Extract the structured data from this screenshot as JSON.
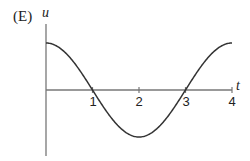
{
  "figure": {
    "label": "(E)"
  },
  "chart_data": {
    "type": "line",
    "title": "",
    "panel_label": "(E)",
    "xlabel": "t",
    "ylabel": "u",
    "xticks": [
      1,
      2,
      3,
      4
    ],
    "xtick_labels": [
      "1",
      "2",
      "3",
      "4"
    ],
    "xlim": [
      0,
      4
    ],
    "ylim": [
      -1.2,
      1.2
    ],
    "grid": false,
    "legend": null,
    "series": [
      {
        "name": "u(t)",
        "x": [
          0,
          0.25,
          0.5,
          0.75,
          1,
          1.25,
          1.5,
          1.75,
          2,
          2.25,
          2.5,
          2.75,
          3,
          3.25,
          3.5,
          3.75,
          4
        ],
        "y": [
          1,
          0.92,
          0.71,
          0.38,
          0,
          -0.38,
          -0.71,
          -0.92,
          -1,
          -0.92,
          -0.71,
          -0.38,
          0,
          0.38,
          0.71,
          0.92,
          1
        ]
      }
    ]
  },
  "axes": {
    "x_label": "t",
    "y_label": "u",
    "ticks": [
      "1",
      "2",
      "3",
      "4"
    ]
  }
}
